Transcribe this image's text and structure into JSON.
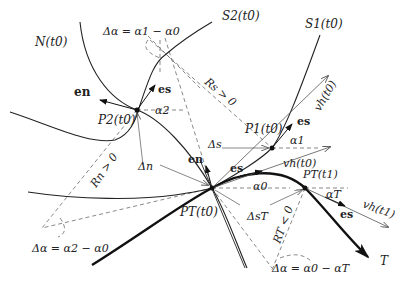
{
  "diagram": {
    "curves": {
      "normal_curve": "N(t0)",
      "streamline_2": "S2(t0)",
      "streamline_1": "S1(t0)",
      "trajectory": "T"
    },
    "points": {
      "p2": "P2(t0)",
      "p1": "P1(t0)",
      "pt0": "PT(t0)",
      "pt1": "PT(t1)"
    },
    "vectors": {
      "en_p2": "en",
      "es_p2": "es",
      "en_pt": "en",
      "es_pt": "es",
      "es_p1": "es",
      "es_pt1": "es",
      "vh_p1": "vh(t0)",
      "vh_pt0": "vh(t0)",
      "vh_pt1": "vh(t1)"
    },
    "angles": {
      "alpha2": "α2",
      "alpha1": "α1",
      "alpha0": "α0",
      "alphaT": "αT"
    },
    "increments": {
      "delta_n": "Δn",
      "delta_s": "Δs",
      "delta_sT": "ΔsT"
    },
    "radii": {
      "rs": "Rs > 0",
      "rn": "Rn > 0",
      "rt": "RT < 0"
    },
    "equations": {
      "eq_top": "Δα = α1 − α0",
      "eq_left": "Δα = α2 − α0",
      "eq_bottom": "Δα = α0 − αT"
    }
  }
}
